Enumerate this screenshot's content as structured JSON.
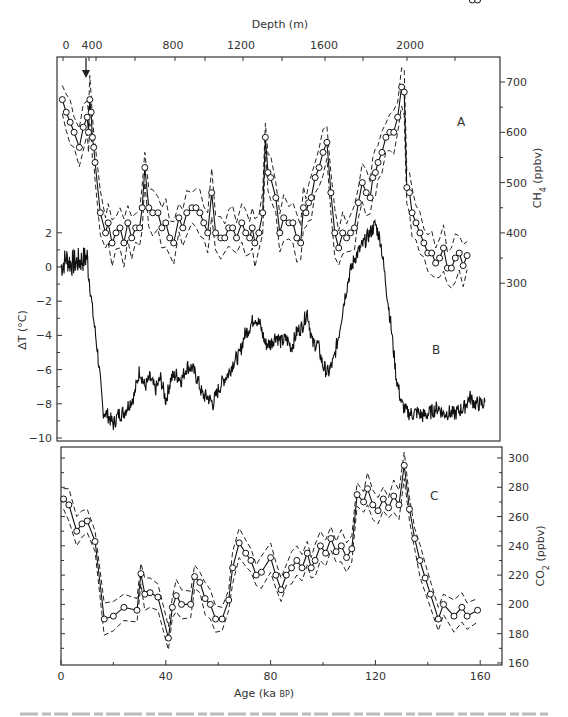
{
  "chart_data": [
    {
      "type": "line",
      "panel": "A",
      "title": "",
      "xlabel": "Age (ka BP)",
      "top_axis": {
        "label": "Depth (m)",
        "ticks": [
          "0",
          "400",
          "800",
          "1200",
          "1600",
          "2000"
        ]
      },
      "ylabel": "CH4 (ppbv)",
      "y_axis_side": "right",
      "yticks": [
        300,
        400,
        500,
        600,
        700
      ],
      "ylim": [
        250,
        750
      ],
      "markers": "open-circles",
      "envelope": "dashed upper/lower bounds",
      "annotation": "down-arrow at top near depth ~350 m",
      "series": [
        {
          "name": "CH4",
          "x": [
            0.5,
            2,
            3.5,
            5,
            7,
            8.5,
            10,
            10.5,
            11,
            11.5,
            12,
            12.5,
            13,
            15,
            17,
            18,
            19.5,
            21,
            22.5,
            24,
            25.5,
            27,
            28.5,
            30,
            31,
            32,
            33.5,
            35,
            37,
            38.5,
            40,
            41.5,
            43,
            45,
            46.5,
            48,
            50,
            51.5,
            53,
            54.5,
            56,
            57.5,
            59,
            61,
            62.5,
            64,
            65.5,
            67,
            69,
            70.5,
            72,
            73,
            74,
            75.5,
            77,
            78,
            79,
            80,
            82,
            83.5,
            85,
            87,
            88.5,
            90,
            91.5,
            92.5,
            93.5,
            94.5,
            95.5,
            97,
            98.5,
            100,
            101.5,
            103,
            104.5,
            106,
            107.5,
            109,
            110.5,
            112,
            113.5,
            115,
            116.5,
            118,
            119,
            120,
            121,
            122.5,
            124,
            125.5,
            127,
            128.5,
            130,
            131,
            132,
            133,
            134,
            135.5,
            137,
            138.5,
            140,
            141.5,
            143,
            144.5,
            146,
            147.5,
            149,
            150.5,
            152,
            153.5,
            155,
            157,
            159
          ],
          "values": [
            665,
            640,
            620,
            600,
            570,
            610,
            630,
            600,
            665,
            640,
            590,
            570,
            540,
            440,
            400,
            420,
            380,
            400,
            410,
            380,
            420,
            390,
            410,
            410,
            450,
            530,
            450,
            440,
            440,
            410,
            420,
            390,
            380,
            430,
            410,
            440,
            450,
            450,
            440,
            420,
            400,
            480,
            400,
            390,
            390,
            410,
            410,
            390,
            420,
            400,
            390,
            410,
            380,
            400,
            440,
            590,
            520,
            510,
            470,
            400,
            430,
            420,
            420,
            390,
            380,
            450,
            440,
            460,
            470,
            510,
            530,
            560,
            580,
            480,
            400,
            370,
            400,
            390,
            400,
            410,
            460,
            500,
            480,
            470,
            510,
            520,
            540,
            560,
            590,
            600,
            600,
            630,
            690,
            680,
            490,
            480,
            440,
            420,
            400,
            380,
            360,
            360,
            340,
            350,
            370,
            330,
            330,
            350,
            360,
            335,
            355
          ]
        },
        {
          "name": "CH4 upper bound",
          "note": "dashed"
        },
        {
          "name": "CH4 lower bound",
          "note": "dashed"
        }
      ]
    },
    {
      "type": "line",
      "panel": "B",
      "xlabel": "Age (ka BP)",
      "ylabel": "ΔT (°C)",
      "y_axis_side": "left",
      "yticks": [
        2,
        0,
        -2,
        -4,
        -6,
        -8,
        -10
      ],
      "ylim": [
        -10.2,
        3
      ],
      "series": [
        {
          "name": "ΔT",
          "x": [
            0,
            2,
            4,
            6,
            8,
            10,
            11,
            12,
            14,
            16,
            18,
            20,
            22,
            24,
            26,
            28,
            30,
            32,
            34,
            36,
            38,
            40,
            42,
            44,
            46,
            48,
            50,
            52,
            54,
            56,
            58,
            60,
            62,
            64,
            66,
            68,
            70,
            72,
            74,
            76,
            78,
            80,
            82,
            84,
            86,
            88,
            90,
            92,
            94,
            96,
            98,
            100,
            102,
            104,
            106,
            108,
            110,
            112,
            114,
            116,
            118,
            120,
            122,
            124,
            126,
            128,
            130,
            132,
            134,
            136,
            138,
            140,
            142,
            144,
            146,
            148,
            150,
            152,
            154,
            156,
            158,
            160,
            162
          ],
          "values": [
            0,
            0.5,
            0.2,
            0.3,
            0.4,
            0.6,
            -1,
            -2.5,
            -5,
            -8.4,
            -8.7,
            -9.2,
            -8.6,
            -8.5,
            -8,
            -7.5,
            -6,
            -7,
            -6.5,
            -7.2,
            -6.5,
            -7.8,
            -6.5,
            -6.3,
            -6.6,
            -5.8,
            -5.9,
            -6.5,
            -7.5,
            -7.6,
            -8,
            -7.2,
            -6.6,
            -6.2,
            -5.5,
            -5.2,
            -4,
            -3.5,
            -2.9,
            -3.4,
            -4.5,
            -4.5,
            -4,
            -4.4,
            -4.2,
            -4.7,
            -3.8,
            -3.5,
            -2.6,
            -4.5,
            -4.5,
            -5.8,
            -6.2,
            -5.5,
            -4,
            -2,
            -0.5,
            0.5,
            1,
            1.5,
            2,
            2.5,
            1.5,
            -1,
            -3.5,
            -6.5,
            -8,
            -8.5,
            -8.6,
            -8.5,
            -8.7,
            -8.6,
            -8.4,
            -8.2,
            -8.6,
            -8.5,
            -8.6,
            -8.4,
            -8.2,
            -7.6,
            -8,
            -8,
            -8
          ]
        }
      ]
    },
    {
      "type": "line",
      "panel": "C",
      "xlabel": "Age (ka BP)",
      "xticks": [
        0,
        40,
        80,
        120,
        160
      ],
      "xlim": [
        0,
        168
      ],
      "ylabel": "CO2 (ppbv)",
      "y_axis_side": "right",
      "yticks": [
        160,
        180,
        200,
        220,
        240,
        260,
        280,
        300
      ],
      "ylim": [
        160,
        310
      ],
      "markers": "open-circles",
      "envelope": "dashed upper/lower bounds",
      "series": [
        {
          "name": "CO2",
          "x": [
            1,
            3,
            6,
            8,
            10,
            13,
            16.5,
            20,
            24,
            29,
            30.5,
            32,
            34,
            37,
            41,
            42.5,
            44,
            46,
            49.5,
            51,
            53,
            55,
            57,
            59,
            61.5,
            64,
            65.5,
            68,
            70.5,
            72.5,
            74.5,
            76.5,
            80,
            82,
            84,
            86,
            88,
            90,
            92,
            94,
            95.5,
            97,
            99,
            101,
            103,
            105,
            107,
            109,
            111,
            113,
            115.5,
            117,
            119,
            121,
            123,
            125,
            127,
            129,
            131,
            133,
            135,
            137,
            139,
            141,
            144,
            146,
            150,
            153,
            155,
            159
          ],
          "values": [
            272,
            268,
            250,
            255,
            257,
            243,
            190,
            192,
            198,
            196,
            221,
            207,
            208,
            205,
            177,
            198,
            206,
            200,
            200,
            219,
            215,
            204,
            200,
            190,
            190,
            203,
            225,
            242,
            235,
            230,
            220,
            222,
            232,
            220,
            210,
            220,
            225,
            230,
            225,
            235,
            225,
            230,
            240,
            235,
            245,
            236,
            240,
            232,
            238,
            275,
            270,
            279,
            268,
            264,
            272,
            266,
            274,
            268,
            295,
            265,
            245,
            230,
            218,
            207,
            190,
            200,
            192,
            198,
            192,
            196
          ]
        },
        {
          "name": "CO2 upper bound",
          "note": "dashed"
        },
        {
          "name": "CO2 lower bound",
          "note": "dashed"
        }
      ]
    }
  ],
  "labels": {
    "depth_title": "Depth (m)",
    "depth_ticks": [
      "0",
      "400",
      "800",
      "1200",
      "1600",
      "2000"
    ],
    "age_title_main": "Age (ka ",
    "age_title_small": "BP",
    "age_title_end": ")",
    "age_ticks": [
      "0",
      "40",
      "80",
      "120",
      "160"
    ],
    "ch4_title": "CH",
    "ch4_sub": "4",
    "ch4_unit": " (ppbv)",
    "co2_title": "CO",
    "co2_sub": "2",
    "co2_unit": " (ppbv)",
    "dt_title": "ΔT (°C)",
    "dt_ticks": [
      "2",
      "0",
      "−2",
      "−4",
      "−6",
      "−8",
      "−10"
    ],
    "ch4_ticks": [
      "700",
      "600",
      "500",
      "400",
      "300"
    ],
    "co2_ticks": [
      "300",
      "280",
      "260",
      "240",
      "220",
      "200",
      "180",
      "160"
    ],
    "panel_a": "A",
    "panel_b": "B",
    "panel_c": "C"
  }
}
